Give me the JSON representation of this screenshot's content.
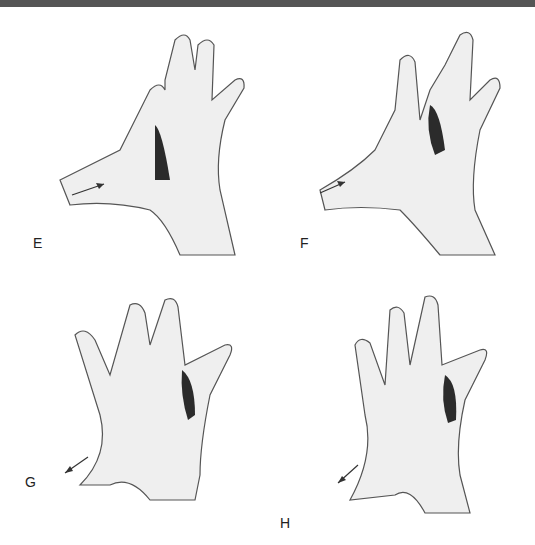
{
  "banner": {
    "text": "",
    "color": "#555555"
  },
  "figure": {
    "panels": [
      {
        "label": "E",
        "description": "Hand massage technique, thumb pushing along dorsal hand, arrow toward fingers, shaded region between metacarpals"
      },
      {
        "label": "F",
        "description": "Hand massage technique, thumb gliding between index and middle metacarpals, arrow toward fingers"
      },
      {
        "label": "G",
        "description": "Interlaced hands, fingers pressing between digits, arrow pointing down-left along forearm"
      },
      {
        "label": "H",
        "description": "Interlaced hands, pressure between ring and little finger, arrow pointing down-left along forearm"
      }
    ]
  },
  "colors": {
    "skin": "#efefef",
    "line": "#555555",
    "shade": "#2b2b2b"
  }
}
